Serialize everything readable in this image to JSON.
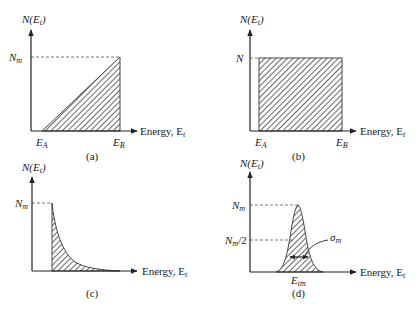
{
  "panels": [
    {
      "id": "a",
      "caption": "(a)",
      "y_label": "N(E",
      "y_label_sub": "t",
      "y_label_close": ")",
      "x_label": "Energy, E",
      "x_label_sub": "t",
      "level_label": "N",
      "level_label_sub": "m",
      "tick_labels": [
        {
          "main": "E",
          "sub": "A"
        },
        {
          "main": "E",
          "sub": "B"
        }
      ],
      "shape": "linear ramp from 0 at E_A to N_m at E_B"
    },
    {
      "id": "b",
      "caption": "(b)",
      "y_label": "N(E",
      "y_label_sub": "t",
      "y_label_close": ")",
      "x_label": "Energy, E",
      "x_label_sub": "t",
      "level_label": "N",
      "level_label_sub": "",
      "tick_labels": [
        {
          "main": "E",
          "sub": "A"
        },
        {
          "main": "E",
          "sub": "B"
        }
      ],
      "shape": "uniform (constant N between E_A and E_B)"
    },
    {
      "id": "c",
      "caption": "(c)",
      "y_label": "N(E",
      "y_label_sub": "t",
      "y_label_close": ")",
      "x_label": "Energy, E",
      "x_label_sub": "t",
      "level_label": "N",
      "level_label_sub": "m",
      "shape": "exponential decay from N_m"
    },
    {
      "id": "d",
      "caption": "(d)",
      "y_label": "N(E",
      "y_label_sub": "t",
      "y_label_close": ")",
      "x_label": "Energy, E",
      "x_label_sub": "t",
      "level_label": "N",
      "level_label_sub": "m",
      "half_label": "N",
      "half_label_sub": "m",
      "half_label_suffix": "/2",
      "peak_label": "E",
      "peak_label_sub": "tm",
      "width_label": "σ",
      "width_label_sub": "m",
      "shape": "Gaussian centered at E_tm with width σ_m"
    }
  ],
  "colors": {
    "line": "#222222",
    "hatch": "#444444",
    "dash": "#555555"
  }
}
